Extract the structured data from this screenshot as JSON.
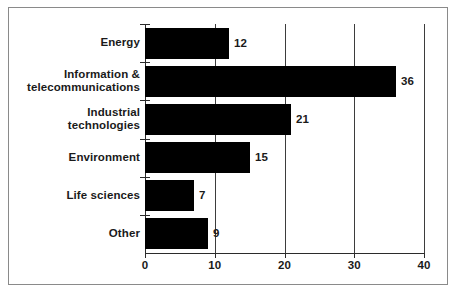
{
  "chart_data": {
    "type": "bar",
    "orientation": "horizontal",
    "title": "",
    "subtitle": "",
    "xlabel": "",
    "ylabel": "",
    "categories": [
      "Energy",
      "Information &\ntelecommunications",
      "Industrial\ntechnologies",
      "Environment",
      "Life sciences",
      "Other"
    ],
    "values": [
      12,
      36,
      21,
      15,
      7,
      9
    ],
    "value_labels": [
      "12",
      "36",
      "21",
      "15",
      "7",
      "9"
    ],
    "xlim": [
      0,
      40
    ],
    "xticks": [
      0,
      10,
      20,
      30,
      40
    ],
    "xtick_labels": [
      "0",
      "10",
      "20",
      "30",
      "40"
    ],
    "grid": true,
    "grid_axis": "x",
    "legend": null,
    "bar_color": "#000000",
    "axis_color": "#2b2b2b",
    "grid_color": "#3d3d3d",
    "frame_color": "#8a8a8a",
    "background_color": "#ffffff",
    "text_color": "#1a1a1a"
  },
  "category_label_lines": [
    [
      "Energy"
    ],
    [
      "Information &",
      "telecommunications"
    ],
    [
      "Industrial",
      "technologies"
    ],
    [
      "Environment"
    ],
    [
      "Life sciences"
    ],
    [
      "Other"
    ]
  ]
}
